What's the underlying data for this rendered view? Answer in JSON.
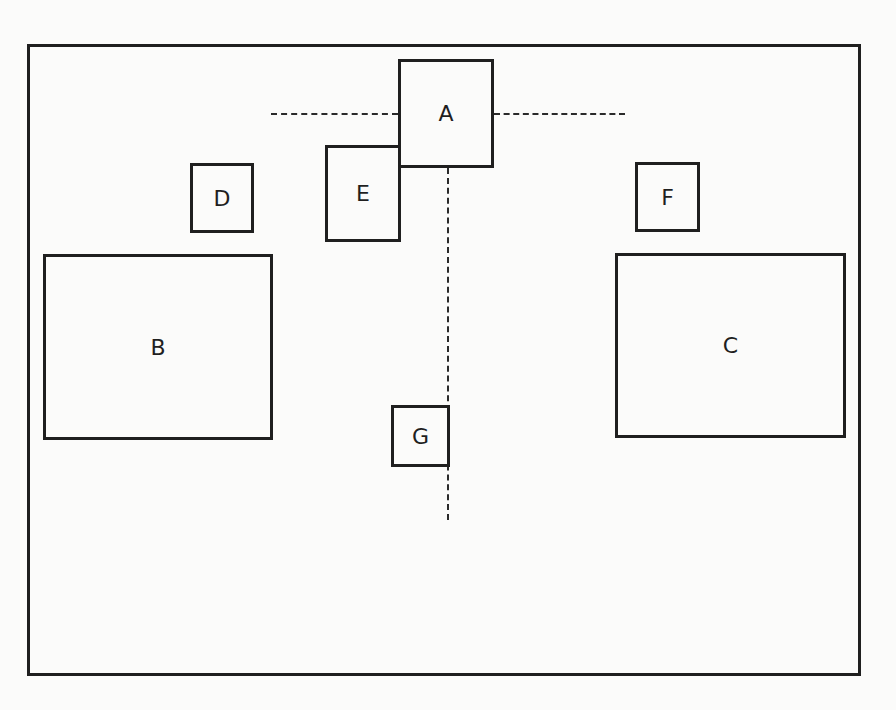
{
  "diagram": {
    "type": "floor-plan-layout",
    "frame": {
      "x": 27,
      "y": 44,
      "width": 831,
      "height": 629
    },
    "boxes": [
      {
        "id": "A",
        "label": "A",
        "x": 398,
        "y": 59,
        "width": 96,
        "height": 109
      },
      {
        "id": "B",
        "label": "B",
        "x": 43,
        "y": 254,
        "width": 230,
        "height": 186
      },
      {
        "id": "C",
        "label": "C",
        "x": 615,
        "y": 253,
        "width": 231,
        "height": 185
      },
      {
        "id": "D",
        "label": "D",
        "x": 190,
        "y": 163,
        "width": 64,
        "height": 70
      },
      {
        "id": "E",
        "label": "E",
        "x": 325,
        "y": 145,
        "width": 76,
        "height": 97
      },
      {
        "id": "F",
        "label": "F",
        "x": 635,
        "y": 162,
        "width": 65,
        "height": 70
      },
      {
        "id": "G",
        "label": "G",
        "x": 391,
        "y": 405,
        "width": 59,
        "height": 62
      }
    ],
    "dashed_lines": [
      {
        "id": "axis-horizontal-left",
        "orientation": "horizontal",
        "x1": 271,
        "x2": 398,
        "y": 114
      },
      {
        "id": "axis-horizontal-right",
        "orientation": "horizontal",
        "x1": 494,
        "x2": 625,
        "y": 114
      },
      {
        "id": "axis-vertical",
        "orientation": "vertical",
        "x": 448,
        "y1": 168,
        "y2": 520
      }
    ],
    "caption": "",
    "colors": {
      "stroke": "#1f1f1f",
      "background": "#fbfbfa"
    }
  }
}
